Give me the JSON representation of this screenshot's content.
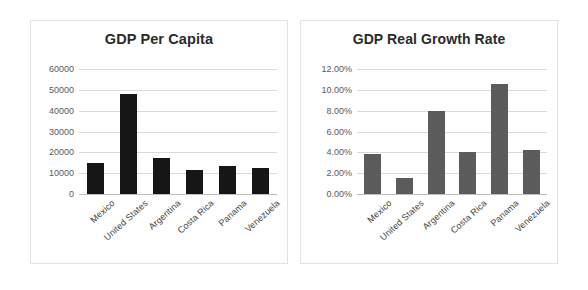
{
  "chart_data": [
    {
      "id": "gdp-per-capita",
      "type": "bar",
      "title": "GDP Per Capita",
      "xlabel": "",
      "ylabel": "",
      "categories": [
        "Mexico",
        "United States",
        "Argentina",
        "Costa Rica",
        "Panama",
        "Venezuela"
      ],
      "values": [
        15000,
        48000,
        17500,
        11500,
        13500,
        12500
      ],
      "ylim": [
        0,
        60000
      ],
      "yticks": [
        60000,
        50000,
        40000,
        30000,
        20000,
        10000,
        0
      ],
      "ytick_labels": [
        "60000",
        "50000",
        "40000",
        "30000",
        "20000",
        "10000",
        "0"
      ],
      "grid": true,
      "legend": "none",
      "bar_color": "#161616"
    },
    {
      "id": "gdp-real-growth-rate",
      "type": "bar",
      "title": "GDP Real Growth Rate",
      "xlabel": "",
      "ylabel": "",
      "categories": [
        "Mexico",
        "United States",
        "Argentina",
        "Costa Rica",
        "Panama",
        "Venezuela"
      ],
      "values": [
        3.8,
        1.5,
        8.0,
        4.0,
        10.6,
        4.2
      ],
      "ylim": [
        0,
        12
      ],
      "yticks": [
        12,
        10,
        8,
        6,
        4,
        2,
        0
      ],
      "ytick_labels": [
        "12.00%",
        "10.00%",
        "8.00%",
        "6.00%",
        "4.00%",
        "2.00%",
        "0.00%"
      ],
      "grid": true,
      "legend": "none",
      "bar_color": "#5b5b5b"
    }
  ],
  "left": {
    "title": "GDP Per Capita",
    "yticks": [
      "60000",
      "50000",
      "40000",
      "30000",
      "20000",
      "10000",
      "0"
    ],
    "categories": [
      "Mexico",
      "United States",
      "Argentina",
      "Costa Rica",
      "Panama",
      "Venezuela"
    ]
  },
  "right": {
    "title": "GDP Real Growth Rate",
    "yticks": [
      "12.00%",
      "10.00%",
      "8.00%",
      "6.00%",
      "4.00%",
      "2.00%",
      "0.00%"
    ],
    "categories": [
      "Mexico",
      "United States",
      "Argentina",
      "Costa Rica",
      "Panama",
      "Venezuela"
    ]
  }
}
